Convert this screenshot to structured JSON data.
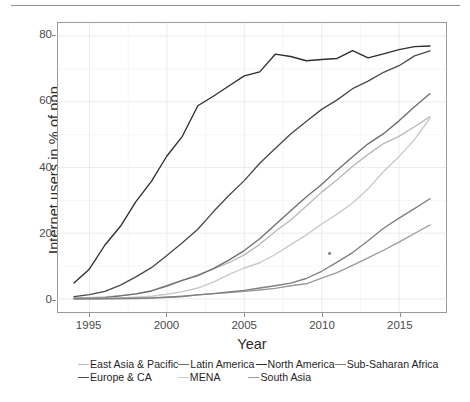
{
  "chart_data": {
    "type": "line",
    "title": "",
    "xlabel": "Year",
    "ylabel": "Internet users in % of pop.",
    "xlim": [
      1994,
      2017
    ],
    "ylim": [
      0,
      80
    ],
    "xticks": [
      1995,
      2000,
      2005,
      2010,
      2015
    ],
    "yticks": [
      0,
      20,
      40,
      60,
      80
    ],
    "grid": true,
    "legend_position": "bottom",
    "x": [
      1994,
      1995,
      1996,
      1997,
      1998,
      1999,
      2000,
      2001,
      2002,
      2003,
      2004,
      2005,
      2006,
      2007,
      2008,
      2009,
      2010,
      2011,
      2012,
      2013,
      2014,
      2015,
      2016,
      2017
    ],
    "series": [
      {
        "name": "East Asia & Pacific",
        "color": "#b8b8b8",
        "values": [
          0.3,
          0.4,
          0.6,
          1.0,
          1.5,
          2.4,
          4.2,
          5.6,
          7.3,
          9.1,
          11.0,
          13.4,
          16.6,
          20.5,
          24.0,
          28.2,
          32.5,
          36.3,
          40.4,
          44.0,
          47.3,
          49.5,
          52.4,
          55.5
        ],
        "final_value": 55.5
      },
      {
        "name": "Europe & CA",
        "color": "#4a4a4a",
        "values": [
          0.7,
          1.3,
          2.3,
          4.2,
          6.7,
          9.5,
          13.2,
          17.1,
          21.2,
          26.5,
          31.5,
          36.0,
          41.3,
          45.8,
          50.2,
          54.0,
          57.7,
          60.6,
          64.0,
          66.3,
          69.0,
          71.0,
          74.0,
          75.5
        ],
        "final_value": 75.5
      },
      {
        "name": "Latin America",
        "color": "#6e6e6e",
        "values": [
          0.1,
          0.2,
          0.4,
          0.9,
          1.5,
          2.4,
          3.9,
          5.6,
          7.1,
          9.2,
          11.8,
          14.7,
          18.3,
          22.6,
          26.8,
          31.0,
          34.8,
          39.2,
          43.3,
          47.2,
          50.3,
          54.2,
          58.5,
          62.5
        ]
      },
      {
        "name": "MENA",
        "color": "#c9c9c9",
        "values": [
          0.0,
          0.1,
          0.2,
          0.3,
          0.5,
          0.8,
          1.4,
          2.2,
          3.3,
          5.1,
          7.4,
          9.4,
          11.0,
          13.5,
          16.5,
          19.4,
          22.8,
          25.8,
          29.2,
          33.5,
          38.8,
          43.3,
          48.5,
          55.0
        ]
      },
      {
        "name": "North America",
        "color": "#2e2e2e",
        "values": [
          4.8,
          9.1,
          16.4,
          22.1,
          29.6,
          35.8,
          43.5,
          49.5,
          58.8,
          61.7,
          64.8,
          67.9,
          69.1,
          74.5,
          73.8,
          72.5,
          72.9,
          73.2,
          75.6,
          73.4,
          74.6,
          75.9,
          76.8,
          77.0
        ]
      },
      {
        "name": "South Asia",
        "color": "#9a9a9a",
        "values": [
          0.0,
          0.0,
          0.0,
          0.1,
          0.1,
          0.2,
          0.5,
          0.7,
          1.2,
          1.6,
          1.9,
          2.3,
          2.7,
          3.2,
          4.0,
          4.6,
          6.3,
          8.0,
          10.2,
          12.5,
          14.8,
          17.3,
          19.9,
          22.5
        ]
      },
      {
        "name": "Sub-Saharan Africa",
        "color": "#7f7f7f",
        "values": [
          0.0,
          0.0,
          0.1,
          0.1,
          0.2,
          0.3,
          0.5,
          0.8,
          1.2,
          1.6,
          2.1,
          2.6,
          3.3,
          4.0,
          4.8,
          6.2,
          8.4,
          11.2,
          14.1,
          17.7,
          21.5,
          24.6,
          27.5,
          30.5
        ]
      }
    ]
  },
  "axes": {
    "y_label": "Internet users in % of pop.",
    "x_label": "Year",
    "y_ticks": [
      "0",
      "20",
      "40",
      "60",
      "80"
    ],
    "x_ticks": [
      "1995",
      "2000",
      "2005",
      "2010",
      "2015"
    ]
  },
  "legend": {
    "row1": [
      {
        "label": "East Asia & Pacific",
        "color": "#b8b8b8"
      },
      {
        "label": "Latin America",
        "color": "#6e6e6e"
      },
      {
        "label": "North America",
        "color": "#2e2e2e"
      },
      {
        "label": "Sub-Saharan Africa",
        "color": "#7f7f7f"
      }
    ],
    "row2": [
      {
        "label": "Europe & CA",
        "color": "#4a4a4a"
      },
      {
        "label": "MENA",
        "color": "#c9c9c9"
      },
      {
        "label": "South Asia",
        "color": "#9a9a9a"
      }
    ]
  },
  "style": {
    "panel_border": "#9a9a9a",
    "grid_major": "#ebebeb",
    "grid_minor": "#f4f4f4",
    "tick_text": "#4a4a4a",
    "axis_title": "#2b2b2b",
    "top_rule": "#8d8d8d"
  }
}
